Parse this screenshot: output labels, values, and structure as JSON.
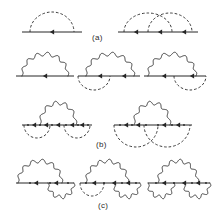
{
  "figure": {
    "background_color": "#ffffff",
    "ink_color": "#262626",
    "width": 220,
    "height": 222,
    "panels": [
      {
        "id": "a",
        "label": "(a)",
        "label_x": 92,
        "label_y": 33,
        "description": "First-order and second-order diagrams with dashed interaction arcs over a fermion line",
        "diagrams": [
          {
            "name": "diagram-a1",
            "x": 20,
            "y": 6,
            "width": 64,
            "height": 30,
            "baseline_y": 26,
            "baseline": {
              "x1": 2,
              "x2": 62
            },
            "arrows_left": [
              32
            ],
            "vertices": [],
            "arcs_above": [
              {
                "style": "dashed",
                "x1": 10,
                "x2": 54,
                "rise": 20
              }
            ],
            "arcs_below": []
          },
          {
            "name": "diagram-a2",
            "x": 116,
            "y": 6,
            "width": 84,
            "height": 30,
            "baseline_y": 26,
            "baseline": {
              "x1": 2,
              "x2": 82
            },
            "arrows_left": [
              20,
              44,
              68
            ],
            "vertices": [],
            "arcs_above": [
              {
                "style": "dashed",
                "x1": 8,
                "x2": 56,
                "rise": 19
              },
              {
                "style": "dashed",
                "x1": 32,
                "x2": 76,
                "rise": 19
              }
            ],
            "arcs_below": []
          }
        ]
      },
      {
        "id": "b",
        "label": "(b)",
        "label_x": 96,
        "label_y": 140,
        "description": "Diagrams mixing a wavy photon arc above the fermion line with dashed interaction arcs below",
        "diagrams": [
          {
            "name": "diagram-b1",
            "x": 14,
            "y": 48,
            "width": 62,
            "height": 32,
            "baseline_y": 28,
            "baseline": {
              "x1": 2,
              "x2": 60
            },
            "arrows_left": [
              31
            ],
            "vertices": [],
            "arcs_above": [
              {
                "style": "wavy",
                "x1": 8,
                "x2": 54,
                "rise": 22,
                "waves": 7
              }
            ],
            "arcs_below": []
          },
          {
            "name": "diagram-b2",
            "x": 76,
            "y": 48,
            "width": 66,
            "height": 42,
            "baseline_y": 28,
            "baseline": {
              "x1": 2,
              "x2": 64
            },
            "arrows_left": [
              24,
              48
            ],
            "vertices": [],
            "arcs_above": [
              {
                "style": "wavy",
                "x1": 10,
                "x2": 58,
                "rise": 22,
                "waves": 7
              }
            ],
            "arcs_below": [
              {
                "style": "dashed",
                "x1": 2,
                "x2": 34,
                "drop": 14
              }
            ]
          },
          {
            "name": "diagram-b3",
            "x": 142,
            "y": 48,
            "width": 66,
            "height": 42,
            "baseline_y": 28,
            "baseline": {
              "x1": 2,
              "x2": 64
            },
            "arrows_left": [
              22,
              50
            ],
            "vertices": [],
            "arcs_above": [
              {
                "style": "wavy",
                "x1": 6,
                "x2": 54,
                "rise": 22,
                "waves": 7
              }
            ],
            "arcs_below": [
              {
                "style": "dashed",
                "x1": 32,
                "x2": 64,
                "drop": 14
              }
            ]
          },
          {
            "name": "diagram-b4",
            "x": 20,
            "y": 98,
            "width": 74,
            "height": 44,
            "baseline_y": 27,
            "baseline": {
              "x1": 2,
              "x2": 72
            },
            "arrows_left": [
              14,
              26,
              38,
              52,
              62
            ],
            "vertices": [
              8,
              20,
              32,
              46,
              58,
              68
            ],
            "arcs_above": [
              {
                "style": "wavy",
                "x1": 20,
                "x2": 56,
                "rise": 22,
                "waves": 6
              }
            ],
            "arcs_below": [
              {
                "style": "dashed",
                "x1": 4,
                "x2": 30,
                "drop": 13
              },
              {
                "style": "dashed",
                "x1": 44,
                "x2": 70,
                "drop": 13
              }
            ]
          },
          {
            "name": "diagram-b5",
            "x": 112,
            "y": 98,
            "width": 82,
            "height": 44,
            "baseline_y": 27,
            "baseline": {
              "x1": 2,
              "x2": 80
            },
            "arrows_left": [
              14,
              26,
              52,
              66
            ],
            "vertices": [
              8,
              20,
              34,
              46,
              60,
              72
            ],
            "arcs_above": [
              {
                "style": "wavy",
                "x1": 22,
                "x2": 58,
                "rise": 22,
                "waves": 6
              }
            ],
            "arcs_below": [
              {
                "style": "dashed",
                "x1": 2,
                "x2": 46,
                "drop": 22
              },
              {
                "style": "dashed",
                "x1": 32,
                "x2": 78,
                "drop": 22
              }
            ]
          }
        ]
      },
      {
        "id": "c",
        "label": "(c)",
        "label_x": 98,
        "label_y": 201,
        "description": "Diagrams with a large wavy photon arc above and smaller wavy or dashed arcs below the fermion line",
        "diagrams": [
          {
            "name": "diagram-c1",
            "x": 14,
            "y": 156,
            "width": 62,
            "height": 44,
            "baseline_y": 27,
            "baseline": {
              "x1": 2,
              "x2": 60
            },
            "arrows_left": [
              22,
              42
            ],
            "vertices": [
              16,
              36,
              54
            ],
            "arcs_above": [
              {
                "style": "wavy",
                "x1": 4,
                "x2": 48,
                "rise": 22,
                "waves": 7
              }
            ],
            "arcs_below": [
              {
                "style": "wavy",
                "x1": 34,
                "x2": 60,
                "drop": 14,
                "waves": 5
              }
            ]
          },
          {
            "name": "diagram-c2",
            "x": 78,
            "y": 156,
            "width": 64,
            "height": 44,
            "baseline_y": 27,
            "baseline": {
              "x1": 2,
              "x2": 62
            },
            "arrows_left": [
              16,
              36,
              50
            ],
            "vertices": [
              8,
              26,
              44,
              58
            ],
            "arcs_above": [
              {
                "style": "wavy",
                "x1": 8,
                "x2": 50,
                "rise": 22,
                "waves": 7
              }
            ],
            "arcs_below": [
              {
                "style": "dashed",
                "x1": 2,
                "x2": 26,
                "drop": 13
              },
              {
                "style": "wavy",
                "x1": 36,
                "x2": 62,
                "drop": 14,
                "waves": 5
              }
            ]
          },
          {
            "name": "diagram-c3",
            "x": 146,
            "y": 156,
            "width": 66,
            "height": 44,
            "baseline_y": 27,
            "baseline": {
              "x1": 2,
              "x2": 64
            },
            "arrows_left": [
              18,
              38,
              52
            ],
            "vertices": [
              10,
              28,
              46,
              60
            ],
            "arcs_above": [
              {
                "style": "wavy",
                "x1": 12,
                "x2": 52,
                "rise": 22,
                "waves": 7
              }
            ],
            "arcs_below": [
              {
                "style": "wavy",
                "x1": 2,
                "x2": 28,
                "drop": 14,
                "waves": 5
              },
              {
                "style": "wavy",
                "x1": 38,
                "x2": 64,
                "drop": 14,
                "waves": 5
              }
            ]
          }
        ]
      }
    ]
  }
}
